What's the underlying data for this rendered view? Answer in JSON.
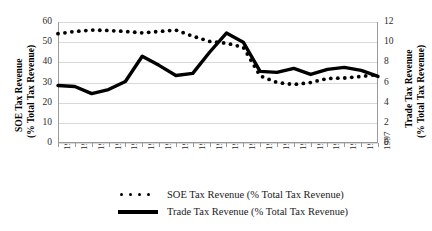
{
  "chart_data": {
    "type": "line",
    "title": "",
    "xlabel": "",
    "categories": [
      "1978",
      "1979",
      "1980",
      "1981",
      "1982",
      "1983",
      "1984",
      "1985",
      "1986",
      "1987",
      "1988",
      "1989",
      "1990",
      "1991",
      "1992",
      "1993",
      "1994",
      "1995",
      "1996",
      "1997"
    ],
    "grid": true,
    "legend_position": "bottom",
    "axes": {
      "left": {
        "label_line1": "SOE Tax Revenue",
        "label_line2": "(% Total Tax Revenue)",
        "ticks": [
          0,
          10,
          20,
          30,
          40,
          50,
          60
        ],
        "ylim": [
          0,
          60
        ]
      },
      "right": {
        "label_line1": "Trade Tax Revenue",
        "label_line2": "(% Total Tax Revenue)",
        "ticks": [
          0,
          2,
          4,
          6,
          8,
          10,
          12
        ],
        "ylim": [
          0,
          12
        ]
      }
    },
    "series": [
      {
        "name": "SOE Tax Revenue (% Total Tax Revenue)",
        "axis": "left",
        "style": "dotted",
        "color": "#000000",
        "values": [
          54.2,
          55.3,
          56.0,
          55.8,
          55.3,
          54.6,
          55.3,
          56.0,
          53.0,
          50.4,
          49.5,
          47.5,
          33.3,
          30.0,
          29.0,
          30.0,
          32.0,
          32.2,
          33.0,
          34.0
        ]
      },
      {
        "name": "Trade Tax Revenue (% Total Tax Revenue)",
        "axis": "right",
        "style": "solid",
        "color": "#000000",
        "values": [
          5.7,
          5.6,
          4.9,
          5.3,
          6.1,
          8.6,
          7.7,
          6.7,
          6.9,
          9.0,
          10.9,
          10.0,
          7.1,
          7.0,
          7.4,
          6.8,
          7.3,
          7.5,
          7.2,
          6.6
        ]
      }
    ]
  },
  "legend": {
    "items": [
      {
        "key": "dotted-marker",
        "label": "SOE Tax Revenue (% Total Tax Revenue)"
      },
      {
        "key": "solid-line",
        "label": "Trade Tax Revenue (% Total Tax Revenue)"
      }
    ]
  }
}
